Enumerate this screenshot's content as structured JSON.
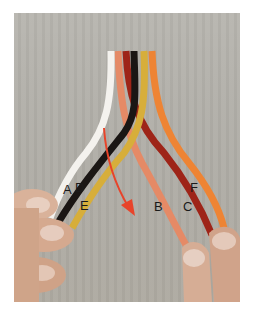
{
  "image": {
    "description": "Hands braiding six colored leather strands",
    "background_color": "#b9b7b1",
    "strands": [
      {
        "color": "#f4f2ee",
        "name": "white"
      },
      {
        "color": "#e58a66",
        "name": "salmon"
      },
      {
        "color": "#9e2418",
        "name": "dark-red"
      },
      {
        "color": "#1a1614",
        "name": "black"
      },
      {
        "color": "#d7ae3a",
        "name": "mustard"
      },
      {
        "color": "#ee8434",
        "name": "orange"
      }
    ],
    "arrow_color": "#e8442a"
  },
  "labels": {
    "a": "A",
    "d": "D",
    "e": "E",
    "b": "B",
    "c": "C",
    "f": "F"
  }
}
